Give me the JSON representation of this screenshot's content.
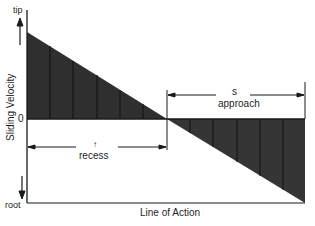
{
  "diagram": {
    "type": "sliding-velocity-along-line-of-action",
    "y_axis": {
      "label": "Sliding Velocity",
      "top_label": "tip",
      "bottom_label": "root",
      "zero_label": "0"
    },
    "x_axis": {
      "label": "Line of Action"
    },
    "regions": [
      {
        "name": "recess",
        "label": "recess",
        "marker": "↑",
        "sign": "positive"
      },
      {
        "name": "approach",
        "label": "approach",
        "marker": "s",
        "sign": "negative"
      }
    ],
    "colors": {
      "fill": "#2f2f2f",
      "stripe": "#111111",
      "line": "#1a1a1a",
      "background": "#ffffff"
    }
  }
}
